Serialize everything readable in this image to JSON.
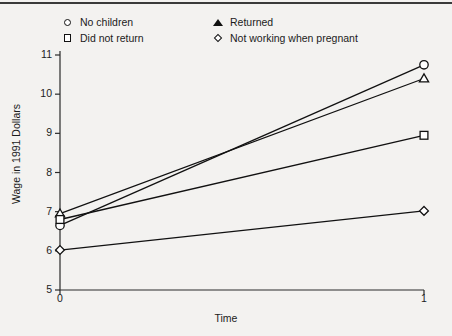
{
  "figure": {
    "background_color": "#f3f2f0",
    "line_color": "#111111",
    "marker_fill": "#ffffff"
  },
  "legend": {
    "items": [
      {
        "label": "No children",
        "marker": "circle-marker"
      },
      {
        "label": "Returned",
        "marker": "triangle-marker"
      },
      {
        "label": "Did not return",
        "marker": "square-marker"
      },
      {
        "label": "Not working when pregnant",
        "marker": "diamond-marker"
      }
    ]
  },
  "chart_data": {
    "type": "line",
    "title": "",
    "xlabel": "Time",
    "ylabel": "Wage in 1991 Dollars",
    "x": [
      0,
      1
    ],
    "xtick_labels": [
      "0",
      "1"
    ],
    "ytick_labels": [
      "5",
      "6",
      "7",
      "8",
      "9",
      "10",
      "11"
    ],
    "yticks": [
      5,
      6,
      7,
      8,
      9,
      10,
      11
    ],
    "xlim": [
      0,
      1
    ],
    "ylim": [
      5,
      11
    ],
    "grid": false,
    "legend_position": "top",
    "series": [
      {
        "name": "No children",
        "marker": "circle",
        "values": [
          6.65,
          10.75
        ]
      },
      {
        "name": "Returned",
        "marker": "triangle",
        "values": [
          6.95,
          10.4
        ]
      },
      {
        "name": "Did not return",
        "marker": "square",
        "values": [
          6.8,
          8.95
        ]
      },
      {
        "name": "Not working when pregnant",
        "marker": "diamond",
        "values": [
          6.02,
          7.02
        ]
      }
    ]
  }
}
